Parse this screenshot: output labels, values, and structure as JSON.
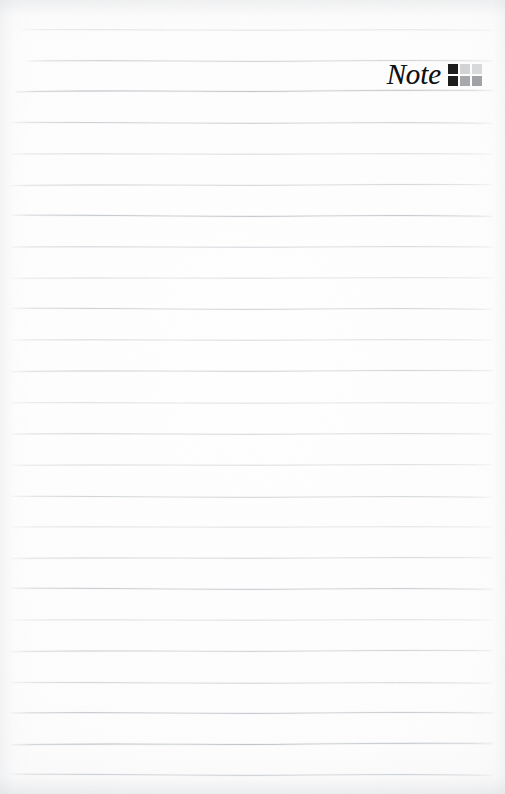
{
  "page": {
    "kind": "lined-notepad-page",
    "width": 505,
    "height": 794,
    "paper_color": "#fdfdfd",
    "edge_shadow_color": "#d0d2d6"
  },
  "brand": {
    "wordmark": "Note",
    "wordmark_color": "#101010",
    "mark_name": "note-logo-grid",
    "mark_columns": 3,
    "mark_rows": 2,
    "mark_cells": [
      {
        "name": "cell-r1c1",
        "color": "#1c1c1c"
      },
      {
        "name": "cell-r1c2",
        "color": "#d2d3d5"
      },
      {
        "name": "cell-r1c3",
        "color": "#d8d9db"
      },
      {
        "name": "cell-r2c1",
        "color": "#1c1c1c"
      },
      {
        "name": "cell-r2c2",
        "color": "#a6a8ac"
      },
      {
        "name": "cell-r2c3",
        "color": "#a0a2a6"
      }
    ]
  },
  "ruling": {
    "line_color": "#9aa0a8",
    "line_color_light": "#c6cad0",
    "first_line_y": 30,
    "spacing": 30.95,
    "count": 25,
    "left_inset": 12,
    "right_inset": 13,
    "lines": [
      {
        "y": 30,
        "x1": 22,
        "x2": 492,
        "opacity": 0.3,
        "wave": 1.2,
        "thickness": 0.8
      },
      {
        "y": 61,
        "x1": 28,
        "x2": 492,
        "opacity": 0.5,
        "wave": 2.0,
        "thickness": 0.9
      },
      {
        "y": 91,
        "x1": 16,
        "x2": 492,
        "opacity": 0.62,
        "wave": 2.4,
        "thickness": 1.0
      },
      {
        "y": 123,
        "x1": 12,
        "x2": 492,
        "opacity": 0.52,
        "wave": 1.6,
        "thickness": 0.9
      },
      {
        "y": 154,
        "x1": 12,
        "x2": 492,
        "opacity": 0.4,
        "wave": 1.1,
        "thickness": 0.8
      },
      {
        "y": 185,
        "x1": 12,
        "x2": 492,
        "opacity": 0.46,
        "wave": 1.8,
        "thickness": 0.9
      },
      {
        "y": 216,
        "x1": 12,
        "x2": 492,
        "opacity": 0.58,
        "wave": 2.2,
        "thickness": 1.0
      },
      {
        "y": 247,
        "x1": 12,
        "x2": 492,
        "opacity": 0.44,
        "wave": 1.4,
        "thickness": 0.9
      },
      {
        "y": 278,
        "x1": 12,
        "x2": 492,
        "opacity": 0.38,
        "wave": 1.0,
        "thickness": 0.8
      },
      {
        "y": 309,
        "x1": 12,
        "x2": 492,
        "opacity": 0.5,
        "wave": 1.9,
        "thickness": 0.9
      },
      {
        "y": 340,
        "x1": 12,
        "x2": 492,
        "opacity": 0.42,
        "wave": 1.3,
        "thickness": 0.8
      },
      {
        "y": 371,
        "x1": 12,
        "x2": 492,
        "opacity": 0.48,
        "wave": 1.7,
        "thickness": 0.9
      },
      {
        "y": 403,
        "x1": 12,
        "x2": 492,
        "opacity": 0.36,
        "wave": 1.0,
        "thickness": 0.8
      },
      {
        "y": 434,
        "x1": 12,
        "x2": 492,
        "opacity": 0.44,
        "wave": 1.5,
        "thickness": 0.9
      },
      {
        "y": 465,
        "x1": 12,
        "x2": 492,
        "opacity": 0.4,
        "wave": 1.2,
        "thickness": 0.8
      },
      {
        "y": 497,
        "x1": 12,
        "x2": 492,
        "opacity": 0.46,
        "wave": 1.8,
        "thickness": 0.9
      },
      {
        "y": 527,
        "x1": 12,
        "x2": 492,
        "opacity": 0.34,
        "wave": 0.9,
        "thickness": 0.8
      },
      {
        "y": 558,
        "x1": 12,
        "x2": 492,
        "opacity": 0.42,
        "wave": 1.4,
        "thickness": 0.9
      },
      {
        "y": 589,
        "x1": 12,
        "x2": 492,
        "opacity": 0.52,
        "wave": 2.0,
        "thickness": 1.0
      },
      {
        "y": 620,
        "x1": 12,
        "x2": 492,
        "opacity": 0.38,
        "wave": 1.1,
        "thickness": 0.8
      },
      {
        "y": 651,
        "x1": 12,
        "x2": 492,
        "opacity": 0.5,
        "wave": 1.9,
        "thickness": 0.9
      },
      {
        "y": 683,
        "x1": 12,
        "x2": 492,
        "opacity": 0.44,
        "wave": 1.5,
        "thickness": 0.9
      },
      {
        "y": 713,
        "x1": 12,
        "x2": 492,
        "opacity": 0.56,
        "wave": 2.2,
        "thickness": 1.0
      },
      {
        "y": 744,
        "x1": 12,
        "x2": 492,
        "opacity": 0.6,
        "wave": 2.6,
        "thickness": 1.1
      },
      {
        "y": 775,
        "x1": 12,
        "x2": 492,
        "opacity": 0.52,
        "wave": 2.0,
        "thickness": 1.0
      }
    ]
  }
}
